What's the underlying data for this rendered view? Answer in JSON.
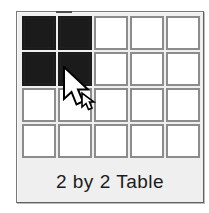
{
  "widget": {
    "name": "table-size-picker",
    "caption": "2 by 2 Table",
    "grid": {
      "rows": 4,
      "columns": 5,
      "selected_rows": 2,
      "selected_columns": 2,
      "cells": [
        [
          true,
          true,
          false,
          false,
          false
        ],
        [
          true,
          true,
          false,
          false,
          false
        ],
        [
          false,
          false,
          false,
          false,
          false
        ],
        [
          false,
          false,
          false,
          false,
          false
        ]
      ]
    },
    "colors": {
      "panel_background": "#efefef",
      "panel_border": "#6e6e6e",
      "cell_background": "#ffffff",
      "cell_border": "#8c8c8c",
      "cell_selected": "#1b1b1b",
      "caption_text": "#1c1c1c",
      "page_background": "#ffffff"
    }
  },
  "cursor": {
    "icon": "arrow-pointer-icon",
    "x": 62,
    "y": 66
  }
}
